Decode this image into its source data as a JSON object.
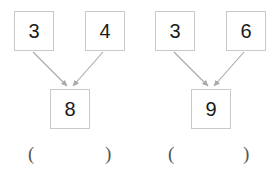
{
  "canvas": {
    "width": 271,
    "height": 174,
    "background": "#ffffff"
  },
  "style": {
    "box_border_color": "#c9c9c9",
    "box_fill": "#ffffff",
    "digit_color": "#1a1a1a",
    "arrow_color": "#a8a8a8",
    "paren_color": "#555555"
  },
  "problems": [
    {
      "id": "problem-1",
      "addend_left": "3",
      "addend_right": "4",
      "sum": "8",
      "answer_open_paren": "(",
      "answer_close_paren": ")",
      "answer_value": ""
    },
    {
      "id": "problem-2",
      "addend_left": "3",
      "addend_right": "6",
      "sum": "9",
      "answer_open_paren": "(",
      "answer_close_paren": ")",
      "answer_value": ""
    }
  ]
}
